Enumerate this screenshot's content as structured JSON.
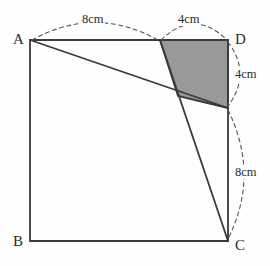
{
  "figure": {
    "colors": {
      "background": "#fefefe",
      "stroke": "#3a3a3a",
      "shade_fill": "#999999",
      "dash_stroke": "#555555",
      "text": "#2b2b2b"
    },
    "square": {
      "name": "square-ABCD",
      "vertices": {
        "A": {
          "label": "A",
          "x": 30,
          "y": 40
        },
        "B": {
          "label": "B",
          "x": 30,
          "y": 241
        },
        "C": {
          "label": "C",
          "x": 228,
          "y": 241
        },
        "D": {
          "label": "D",
          "x": 228,
          "y": 40
        }
      },
      "path": "M 30 40 L 228 40 L 228 241 L 30 241 Z"
    },
    "points": {
      "E": {
        "name": "point-E-on-AD",
        "x": 160,
        "y": 40
      },
      "F": {
        "name": "point-F-on-DC",
        "x": 228,
        "y": 108
      },
      "G": {
        "name": "point-G-intersection",
        "x": 178,
        "y": 96
      }
    },
    "lines": [
      {
        "name": "line-A-to-F",
        "from": "A",
        "to": "F",
        "path": "M 30 40 L 228 108"
      },
      {
        "name": "line-E-to-C",
        "from": "E",
        "to": "C",
        "path": "M 160 40 L 228 241"
      }
    ],
    "shaded_region": {
      "name": "shaded-quadrilateral-EDFG",
      "path": "M 160 40 L 228 40 L 228 108 L 178 96 Z",
      "fill": "#999999"
    },
    "dimension_arcs": [
      {
        "name": "arc-top-left-8cm",
        "label": "8cm",
        "value": 8,
        "unit": "cm",
        "spans": "A to E",
        "path": "M 32 40 Q 95 5 158 40"
      },
      {
        "name": "arc-top-right-4cm",
        "label": "4cm",
        "value": 4,
        "unit": "cm",
        "spans": "E to D",
        "path": "M 161 40 Q 194 8 227 40"
      },
      {
        "name": "arc-right-upper-4cm",
        "label": "4cm",
        "value": 4,
        "unit": "cm",
        "spans": "D to F",
        "path": "M 228 42 Q 252 74 228 106"
      },
      {
        "name": "arc-right-lower-8cm",
        "label": "8cm",
        "value": 8,
        "unit": "cm",
        "spans": "F to C",
        "path": "M 228 110 Q 260 175 228 239"
      }
    ],
    "labels": {
      "vertex_A": "A",
      "vertex_B": "B",
      "vertex_C": "C",
      "vertex_D": "D",
      "top_left_measure": "8cm",
      "top_right_measure": "4cm",
      "right_upper_measure": "4cm",
      "right_lower_measure": "8cm"
    }
  }
}
